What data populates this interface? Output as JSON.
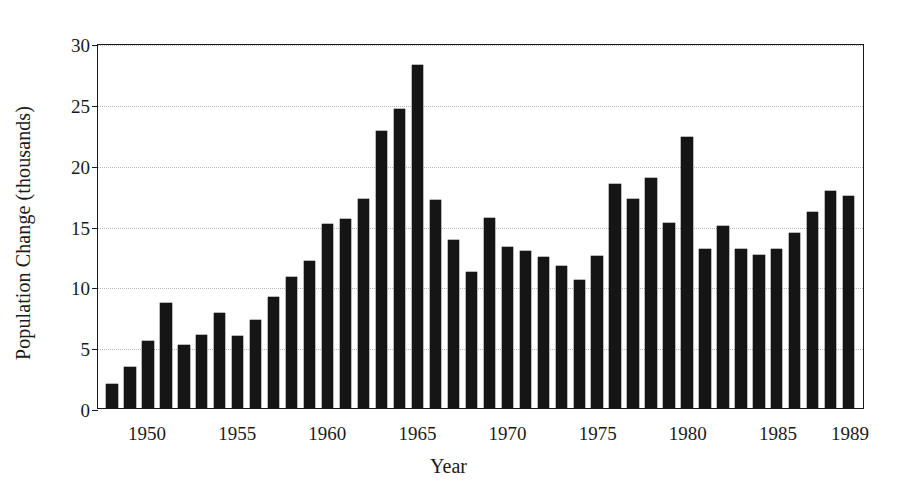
{
  "chart_data": {
    "type": "bar",
    "title": "",
    "xlabel": "Year",
    "ylabel": "Population Change (thousands)",
    "ylim": [
      0,
      30
    ],
    "yticks": [
      0,
      5,
      10,
      15,
      20,
      25,
      30
    ],
    "ytick_labels": [
      "0",
      "5",
      "10",
      "15",
      "20",
      "25",
      "30"
    ],
    "xtick_labels": [
      "1950",
      "1955",
      "1960",
      "1965",
      "1970",
      "1975",
      "1980",
      "1985",
      "1989"
    ],
    "xtick_years": [
      1950,
      1955,
      1960,
      1965,
      1970,
      1975,
      1980,
      1985,
      1989
    ],
    "grid": "horizontal-dotted",
    "legend": "none",
    "bar_color": "#151515",
    "background_color": "#ffffff",
    "categories": [
      "1948",
      "1949",
      "1950",
      "1951",
      "1952",
      "1953",
      "1954",
      "1955",
      "1956",
      "1957",
      "1958",
      "1959",
      "1960",
      "1961",
      "1962",
      "1963",
      "1964",
      "1965",
      "1966",
      "1967",
      "1968",
      "1969",
      "1970",
      "1971",
      "1972",
      "1973",
      "1974",
      "1975",
      "1976",
      "1977",
      "1978",
      "1979",
      "1980",
      "1981",
      "1982",
      "1983",
      "1984",
      "1985",
      "1986",
      "1987",
      "1988",
      "1989"
    ],
    "values": [
      2.0,
      3.4,
      5.5,
      8.6,
      5.2,
      6.0,
      7.8,
      5.9,
      7.2,
      9.1,
      10.8,
      12.1,
      15.1,
      15.5,
      17.2,
      22.8,
      24.6,
      28.2,
      17.1,
      13.8,
      11.2,
      15.6,
      13.2,
      12.9,
      12.4,
      11.7,
      10.5,
      12.5,
      18.4,
      17.2,
      18.9,
      15.2,
      22.3,
      13.1,
      15.0,
      13.1,
      12.6,
      13.1,
      14.4,
      16.1,
      17.8,
      17.4
    ]
  }
}
